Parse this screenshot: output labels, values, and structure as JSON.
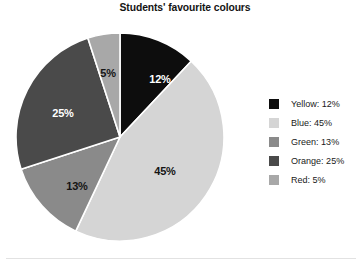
{
  "title": "Students' favourite colours",
  "chart_data": {
    "type": "pie",
    "title": "Students' favourite colours",
    "xlabel": "",
    "ylabel": "",
    "unit": "%",
    "start_angle_deg": 0,
    "direction": "clockwise",
    "legend_position": "right",
    "grid": false,
    "categories": [
      "Yellow",
      "Blue",
      "Green",
      "Orange",
      "Red"
    ],
    "values": [
      12,
      45,
      13,
      25,
      5
    ],
    "labels": [
      "12%",
      "45%",
      "13%",
      "25%",
      "5%"
    ],
    "colors": [
      "#0d0d0d",
      "#d5d5d5",
      "#8a8a8a",
      "#4a4a4a",
      "#a8a8a8"
    ],
    "slices": [
      {
        "name": "Yellow",
        "value": 12,
        "label": "12%",
        "color": "#0d0d0d",
        "label_color": "#ffffff",
        "legend_label": "Yellow: 12%",
        "start_deg": 0,
        "end_deg": 43.2,
        "label_x": 145,
        "label_y": 48
      },
      {
        "name": "Blue",
        "value": 45,
        "label": "45%",
        "color": "#d5d5d5",
        "label_color": "#141414",
        "legend_label": "Blue: 45%",
        "start_deg": 43.2,
        "end_deg": 205.2,
        "label_x": 150,
        "label_y": 140
      },
      {
        "name": "Green",
        "value": 13,
        "label": "13%",
        "color": "#8a8a8a",
        "label_color": "#141414",
        "legend_label": "Green: 13%",
        "start_deg": 205.2,
        "end_deg": 252.0,
        "label_x": 62,
        "label_y": 155
      },
      {
        "name": "Orange",
        "value": 25,
        "label": "25%",
        "color": "#4a4a4a",
        "label_color": "#ffffff",
        "legend_label": "Orange: 25%",
        "start_deg": 252.0,
        "end_deg": 342.0,
        "label_x": 48,
        "label_y": 82
      },
      {
        "name": "Red",
        "value": 5,
        "label": "5%",
        "color": "#a8a8a8",
        "label_color": "#141414",
        "legend_label": "Red: 5%",
        "start_deg": 342.0,
        "end_deg": 360.0,
        "label_x": 93,
        "label_y": 42
      }
    ]
  },
  "legend": {
    "items": [
      {
        "label": "Yellow: 12%",
        "color": "#0d0d0d"
      },
      {
        "label": "Blue: 45%",
        "color": "#d5d5d5"
      },
      {
        "label": "Green: 13%",
        "color": "#8a8a8a"
      },
      {
        "label": "Orange: 25%",
        "color": "#4a4a4a"
      },
      {
        "label": "Red: 5%",
        "color": "#a8a8a8"
      }
    ]
  }
}
